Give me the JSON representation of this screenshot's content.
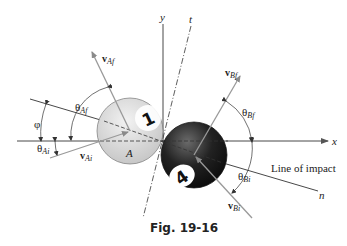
{
  "figure": {
    "caption": "Fig. 19-16",
    "axes": {
      "x_label": "x",
      "y_label": "y",
      "t_label": "t",
      "n_label": "n"
    },
    "line_of_impact_label": "Line of impact",
    "balls": [
      {
        "id": "A",
        "label": "A",
        "number": "1",
        "color": "#d8d8d8"
      },
      {
        "id": "B",
        "number": "4",
        "color": "#1a1a1a"
      }
    ],
    "vectors": {
      "vAf": {
        "main": "v",
        "sub": "Af"
      },
      "vBf": {
        "main": "v",
        "sub": "Bf"
      },
      "vAi": {
        "main": "v",
        "sub": "Ai"
      },
      "vBi": {
        "main": "v",
        "sub": "Bi"
      }
    },
    "angles": {
      "phi": "φ",
      "theta_Af": {
        "main": "θ",
        "sub": "Af"
      },
      "theta_Bf": {
        "main": "θ",
        "sub": "Bf"
      },
      "theta_Ai": {
        "main": "θ",
        "sub": "Ai"
      },
      "theta_Bi": {
        "main": "θ",
        "sub": "Bi"
      }
    },
    "colors": {
      "line": "#333333",
      "arrow": "#999999",
      "ball_a": "#d8d8d8",
      "ball_b": "#1a1a1a"
    }
  }
}
